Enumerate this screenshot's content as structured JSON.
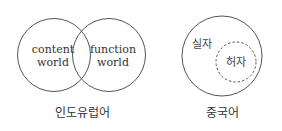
{
  "diagrams": [
    {
      "caption": "인도유럽어",
      "circles": [
        {
          "label_line1": "content",
          "label_line2": "world"
        },
        {
          "label_line1": "function",
          "label_line2": "world"
        }
      ]
    },
    {
      "caption": "중국어",
      "outer_label": "실자",
      "inner_label": "허자"
    }
  ],
  "colors": {
    "stroke": "#555555",
    "text": "#333333",
    "background": "#ffffff"
  }
}
